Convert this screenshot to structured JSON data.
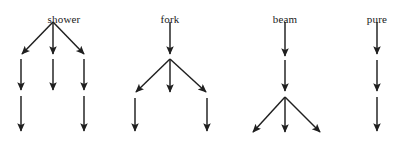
{
  "figure": {
    "type": "tree-diagram-set",
    "width": 411,
    "height": 141,
    "background_color": "#ffffff",
    "arrow_color": "#1f1f1f",
    "label_color": "#1a1a1a"
  },
  "trees": [
    {
      "id": "shower",
      "label": "shower",
      "label_x": 64,
      "label_y": 14,
      "arrows": [
        {
          "name": "shower-branch-left",
          "x1": 53,
          "y1": 22,
          "x2": 22,
          "y2": 54
        },
        {
          "name": "shower-branch-middle",
          "x1": 53,
          "y1": 22,
          "x2": 53,
          "y2": 54
        },
        {
          "name": "shower-branch-right",
          "x1": 53,
          "y1": 22,
          "x2": 84,
          "y2": 54
        },
        {
          "name": "shower-stem-left-upper",
          "x1": 21,
          "y1": 59,
          "x2": 21,
          "y2": 90
        },
        {
          "name": "shower-stem-middle-upper",
          "x1": 53,
          "y1": 59,
          "x2": 53,
          "y2": 90
        },
        {
          "name": "shower-stem-right-upper",
          "x1": 84,
          "y1": 59,
          "x2": 84,
          "y2": 90
        },
        {
          "name": "shower-stem-left-lower",
          "x1": 21,
          "y1": 96,
          "x2": 21,
          "y2": 131
        },
        {
          "name": "shower-stem-right-lower",
          "x1": 84,
          "y1": 96,
          "x2": 84,
          "y2": 131
        }
      ]
    },
    {
      "id": "fork",
      "label": "fork",
      "label_x": 170,
      "label_y": 14,
      "arrows": [
        {
          "name": "fork-stem-top",
          "x1": 170,
          "y1": 22,
          "x2": 170,
          "y2": 54
        },
        {
          "name": "fork-branch-left",
          "x1": 170,
          "y1": 59,
          "x2": 136,
          "y2": 92
        },
        {
          "name": "fork-branch-middle",
          "x1": 170,
          "y1": 59,
          "x2": 170,
          "y2": 92
        },
        {
          "name": "fork-branch-right",
          "x1": 170,
          "y1": 59,
          "x2": 206,
          "y2": 92
        },
        {
          "name": "fork-stem-left-lower",
          "x1": 135,
          "y1": 98,
          "x2": 135,
          "y2": 131
        },
        {
          "name": "fork-stem-right-lower",
          "x1": 207,
          "y1": 98,
          "x2": 207,
          "y2": 131
        }
      ]
    },
    {
      "id": "beam",
      "label": "beam",
      "label_x": 285,
      "label_y": 14,
      "arrows": [
        {
          "name": "beam-stem-upper",
          "x1": 285,
          "y1": 22,
          "x2": 285,
          "y2": 56
        },
        {
          "name": "beam-stem-lower",
          "x1": 285,
          "y1": 60,
          "x2": 285,
          "y2": 91
        },
        {
          "name": "beam-branch-left",
          "x1": 285,
          "y1": 97,
          "x2": 253,
          "y2": 132
        },
        {
          "name": "beam-branch-middle",
          "x1": 285,
          "y1": 97,
          "x2": 285,
          "y2": 132
        },
        {
          "name": "beam-branch-right",
          "x1": 285,
          "y1": 97,
          "x2": 320,
          "y2": 132
        }
      ]
    },
    {
      "id": "pure",
      "label": "pure",
      "label_x": 377,
      "label_y": 14,
      "arrows": [
        {
          "name": "pure-stem-top",
          "x1": 377,
          "y1": 22,
          "x2": 377,
          "y2": 54
        },
        {
          "name": "pure-stem-middle",
          "x1": 377,
          "y1": 60,
          "x2": 377,
          "y2": 91
        },
        {
          "name": "pure-stem-bottom",
          "x1": 377,
          "y1": 97,
          "x2": 377,
          "y2": 131
        }
      ]
    }
  ]
}
